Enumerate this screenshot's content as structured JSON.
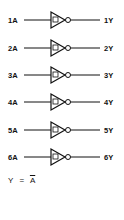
{
  "gates": [
    {
      "input": "1A",
      "output": "1Y"
    },
    {
      "input": "2A",
      "output": "2Y"
    },
    {
      "input": "3A",
      "output": "3Y"
    },
    {
      "input": "4A",
      "output": "4Y"
    },
    {
      "input": "5A",
      "output": "5Y"
    },
    {
      "input": "6A",
      "output": "6Y"
    }
  ],
  "equation": {
    "lhs": "Y",
    "eq": "=",
    "rhs": "A"
  },
  "gate_symbol": "inverter-with-schmitt-trigger"
}
